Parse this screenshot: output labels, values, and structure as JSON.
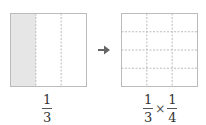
{
  "left": {
    "columns": 3,
    "rows": 1,
    "shaded_columns": 1,
    "label": {
      "numerator": "1",
      "denominator": "3"
    }
  },
  "arrow": {
    "icon": "arrow-right-icon",
    "glyph": "➔"
  },
  "right": {
    "columns": 3,
    "rows": 4,
    "label": {
      "a": {
        "numerator": "1",
        "denominator": "3"
      },
      "operator": "×",
      "b": {
        "numerator": "1",
        "denominator": "4"
      }
    }
  },
  "colors": {
    "border": "#bbbbbb",
    "dash": "#bbbbbb",
    "shade": "#e6e6e6",
    "arrow": "#666666"
  }
}
